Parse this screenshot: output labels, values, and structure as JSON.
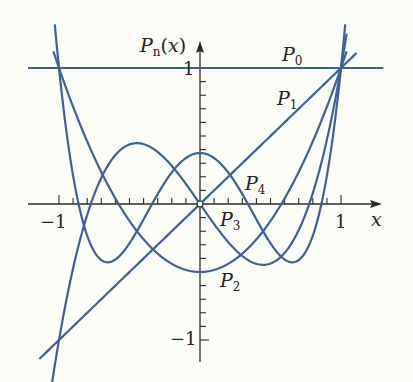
{
  "chart_data": {
    "type": "line",
    "title": "",
    "xlabel": "x",
    "ylabel": "P_n(x)",
    "xlim": [
      -1.25,
      1.3
    ],
    "ylim": [
      -1.15,
      1.15
    ],
    "grid": false,
    "legend": "inline labels",
    "x_ticks": {
      "labeled": [
        -1,
        1
      ],
      "minor_step": 0.1
    },
    "y_ticks": {
      "labeled": [
        -1,
        1
      ],
      "minor_step": 0.1
    },
    "tick_labels": {
      "x_neg": "−1",
      "x_pos": "1",
      "y_pos": "1",
      "y_neg": "−1"
    },
    "series": [
      {
        "name": "P0",
        "formula": "1",
        "coeffs": [
          1
        ],
        "x_range": [
          -1.22,
          1.3
        ]
      },
      {
        "name": "P1",
        "formula": "x",
        "coeffs": [
          0,
          1
        ],
        "x_range": [
          -1.14,
          1.11
        ]
      },
      {
        "name": "P2",
        "formula": "(3x^2-1)/2",
        "coeffs": [
          -0.5,
          0,
          1.5
        ],
        "x_range": [
          -1.04,
          1.04
        ]
      },
      {
        "name": "P3",
        "formula": "(5x^3-3x)/2",
        "coeffs": [
          0,
          -1.5,
          0,
          2.5
        ],
        "x_range": [
          -1.05,
          1.04
        ]
      },
      {
        "name": "P4",
        "formula": "(35x^4-30x^2+3)/8",
        "coeffs": [
          0.375,
          0,
          -3.75,
          0,
          4.375
        ],
        "x_range": [
          -1.03,
          1.03
        ]
      }
    ],
    "annotations": [
      {
        "text": "P",
        "sub": "0",
        "x": 0.58,
        "y": 1.07
      },
      {
        "text": "P",
        "sub": "1",
        "x": 0.55,
        "y": 0.74
      },
      {
        "text": "P",
        "sub": "4",
        "x": 0.33,
        "y": 0.13
      },
      {
        "text": "P",
        "sub": "3",
        "x": 0.14,
        "y": -0.13
      },
      {
        "text": "P",
        "sub": "2",
        "x": 0.14,
        "y": -0.63
      }
    ],
    "colors": {
      "curve": "#3c5fa0",
      "axis": "#2a2a2a",
      "background": "#fdfdf7"
    }
  },
  "labels": {
    "y_axis_P": "P",
    "y_axis_sub": "n",
    "y_axis_arg": "(x)",
    "x_axis": "x",
    "x_neg_one": "−1",
    "x_pos_one": "1",
    "y_pos_one": "1",
    "y_neg_one": "−1",
    "P0": "P",
    "P0_sub": "0",
    "P1": "P",
    "P1_sub": "1",
    "P2": "P",
    "P2_sub": "2",
    "P3": "P",
    "P3_sub": "3",
    "P4": "P",
    "P4_sub": "4"
  }
}
